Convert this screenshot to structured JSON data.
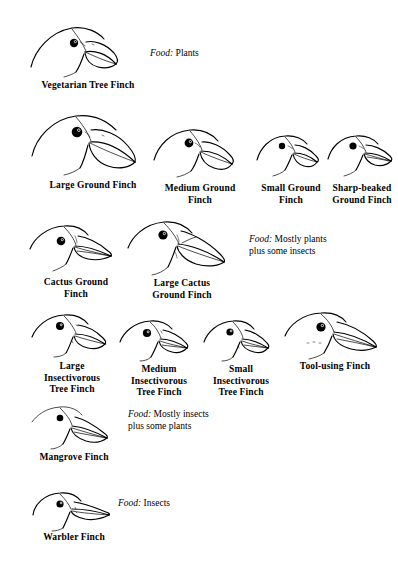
{
  "figure": {
    "background_color": "#ffffff",
    "ink_color": "#000000",
    "width": 398,
    "height": 562
  },
  "rows": [
    {
      "id": "row-vegetarian",
      "food_note": {
        "key": "Food:",
        "value": "Plants"
      },
      "finches": [
        {
          "id": "vegetarian-tree-finch",
          "label": "Vegetarian Tree Finch"
        }
      ]
    },
    {
      "id": "row-ground",
      "finches": [
        {
          "id": "large-ground-finch",
          "label": "Large Ground Finch"
        },
        {
          "id": "medium-ground-finch",
          "label": "Medium Ground\nFinch"
        },
        {
          "id": "small-ground-finch",
          "label": "Small Ground\nFinch"
        },
        {
          "id": "sharp-beaked-ground-finch",
          "label": "Sharp-beaked\nGround Finch"
        }
      ]
    },
    {
      "id": "row-cactus",
      "food_note": {
        "key": "Food:",
        "value": "Mostly plants\nplus some insects"
      },
      "finches": [
        {
          "id": "cactus-ground-finch",
          "label": "Cactus Ground\nFinch"
        },
        {
          "id": "large-cactus-ground-finch",
          "label": "Large Cactus\nGround Finch"
        }
      ]
    },
    {
      "id": "row-insectivorous",
      "finches": [
        {
          "id": "large-insectivorous-tree-finch",
          "label": "Large\nInsectivorous\nTree Finch"
        },
        {
          "id": "medium-insectivorous-tree-finch",
          "label": "Medium\nInsectivorous\nTree Finch"
        },
        {
          "id": "small-insectivorous-tree-finch",
          "label": "Small\nInsectivorous\nTree Finch"
        },
        {
          "id": "tool-using-finch",
          "label": "Tool-using Finch"
        }
      ]
    },
    {
      "id": "row-mangrove",
      "food_note": {
        "key": "Food:",
        "value": "Mostly insects\nplus some plants"
      },
      "finches": [
        {
          "id": "mangrove-finch",
          "label": "Mangrove Finch"
        }
      ]
    },
    {
      "id": "row-warbler",
      "food_note": {
        "key": "Food:",
        "value": "Insects"
      },
      "finches": [
        {
          "id": "warbler-finch",
          "label": "Warbler Finch"
        }
      ]
    }
  ],
  "labels": {
    "vegetarian_tree_finch": "Vegetarian Tree Finch",
    "large_ground_finch": "Large Ground Finch",
    "medium_ground_finch": "Medium Ground\nFinch",
    "small_ground_finch": "Small Ground\nFinch",
    "sharp_beaked_ground_finch": "Sharp-beaked\nGround Finch",
    "cactus_ground_finch": "Cactus Ground\nFinch",
    "large_cactus_ground_finch": "Large Cactus\nGround Finch",
    "large_insectivorous_tree_finch": "Large\nInsectivorous\nTree Finch",
    "medium_insectivorous_tree_finch": "Medium\nInsectivorous\nTree Finch",
    "small_insectivorous_tree_finch": "Small\nInsectivorous\nTree Finch",
    "tool_using_finch": "Tool-using Finch",
    "mangrove_finch": "Mangrove Finch",
    "warbler_finch": "Warbler Finch"
  },
  "food_notes": {
    "plants": {
      "key": "Food:",
      "value": "Plants"
    },
    "mostly_plants": {
      "key": "Food:",
      "value": "Mostly plants\nplus some insects"
    },
    "mostly_insects": {
      "key": "Food:",
      "value": "Mostly insects\nplus some plants"
    },
    "insects": {
      "key": "Food:",
      "value": "Insects"
    }
  }
}
